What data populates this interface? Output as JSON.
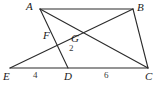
{
  "figure": {
    "kind": "geometry-diagram",
    "width": 159,
    "height": 87,
    "background": "#ffffff",
    "stroke_color": "#2b2b2b",
    "label_color": "#1a1a1a",
    "measure_color": "#3a3a3a"
  },
  "points": {
    "A": {
      "label": "A",
      "x": 40,
      "y": 9,
      "label_x": 26,
      "label_y": 1
    },
    "B": {
      "label": "B",
      "x": 133,
      "y": 9,
      "label_x": 137,
      "label_y": 2
    },
    "C": {
      "label": "C",
      "x": 148,
      "y": 68,
      "label_x": 145,
      "label_y": 71
    },
    "D": {
      "label": "D",
      "x": 68,
      "y": 68,
      "label_x": 64,
      "label_y": 71
    },
    "E": {
      "label": "E",
      "x": 10,
      "y": 68,
      "label_x": 3,
      "label_y": 71
    },
    "F": {
      "label": "F",
      "x": 53,
      "y": 38,
      "label_x": 43,
      "label_y": 30
    },
    "G": {
      "label": "G",
      "x": 75,
      "y": 30,
      "label_x": 71,
      "label_y": 33
    }
  },
  "segments": [
    {
      "name": "segment-AB",
      "from": "A",
      "to": "B"
    },
    {
      "name": "segment-EC",
      "from": "E",
      "to": "C"
    },
    {
      "name": "segment-AC",
      "from": "A",
      "to": "C"
    },
    {
      "name": "segment-AD",
      "from": "A",
      "to": "D"
    },
    {
      "name": "segment-BE",
      "from": "B",
      "to": "E"
    },
    {
      "name": "segment-BC",
      "from": "B",
      "to": "C"
    }
  ],
  "measures": [
    {
      "name": "measure-ED",
      "text": "4",
      "x": 33,
      "y": 71
    },
    {
      "name": "measure-DC",
      "text": "6",
      "x": 104,
      "y": 71
    },
    {
      "name": "measure-GD",
      "text": "2",
      "x": 69,
      "y": 44
    }
  ]
}
